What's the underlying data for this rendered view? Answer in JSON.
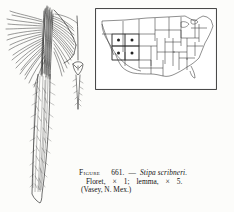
{
  "document": {
    "type": "botanical-illustration-plate",
    "background_color": "#fcfcfa",
    "ink_color": "#1a1a1a"
  },
  "caption": {
    "figure_word": "Figure",
    "figure_number": "661.",
    "dash": "—",
    "species": "Stipa scribneri.",
    "line2_part1": "Floret,",
    "line2_mult1": "×",
    "line2_value1": "1;",
    "line2_part2": "lemma,",
    "line2_mult2": "×",
    "line2_value2": "5.",
    "line3": "(Vasey, N. Mex.)"
  },
  "plant_illustration": {
    "name": "stipa-scribneri-floret",
    "description": "Feathery grass floret with long radiating awns above a narrow tapering spike body",
    "magnification": "× 1"
  },
  "lemma_illustration": {
    "name": "lemma-detail",
    "description": "Enlarged lemma with callus and slender awn",
    "magnification": "× 5"
  },
  "map": {
    "name": "distribution-map-united-states",
    "frame_color": "#2b2b2b",
    "marker_symbol": "dot",
    "marked_states": [
      {
        "name": "Utah",
        "marker": "dot"
      },
      {
        "name": "Colorado",
        "marker": "dot"
      },
      {
        "name": "Arizona",
        "marker": "dot"
      },
      {
        "name": "New Mexico",
        "marker": "dot"
      }
    ],
    "marked_state_count": 4,
    "region_label": "Four Corners"
  }
}
